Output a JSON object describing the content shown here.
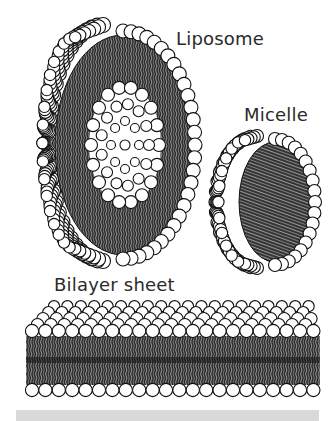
{
  "figure": {
    "labels": {
      "liposome": "Liposome",
      "micelle": "Micelle",
      "bilayer": "Bilayer sheet"
    },
    "structures": [
      {
        "name": "liposome",
        "description": "hemispherical vesicle cut open showing bilayer shell and aqueous core"
      },
      {
        "name": "micelle",
        "description": "half sphere of hydrophilic heads with hydrophobic tails radiating to the core"
      },
      {
        "name": "bilayer-sheet",
        "description": "flat lipid bilayer with heads on top and bottom, tails in middle"
      }
    ],
    "colors": {
      "head_fill": "#ffffff",
      "head_stroke": "#111111",
      "tail_dark": "#2b2b2b",
      "tail_light": "#8a8a8a",
      "footer_bar": "#d9d9d9",
      "label_text": "#2a2a2a"
    }
  }
}
